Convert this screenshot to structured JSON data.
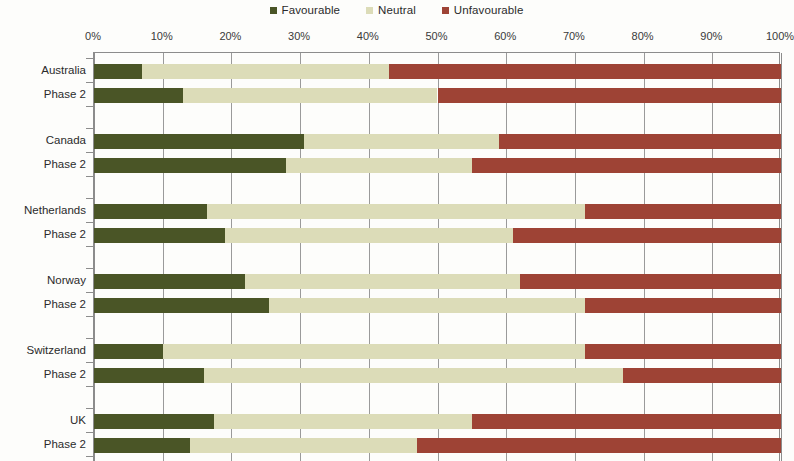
{
  "legend": {
    "items": [
      {
        "label": "Favourable",
        "color": "#4a5526"
      },
      {
        "label": "Neutral",
        "color": "#dcdcb8"
      },
      {
        "label": "Unfavourable",
        "color": "#9e4335"
      }
    ]
  },
  "axis": {
    "x_ticks": [
      "0%",
      "10%",
      "20%",
      "30%",
      "40%",
      "50%",
      "60%",
      "70%",
      "80%",
      "90%",
      "100%"
    ]
  },
  "chart_data": {
    "type": "bar",
    "orientation": "horizontal",
    "stacked": true,
    "stack_total": 100,
    "title": "",
    "xlabel": "",
    "ylabel": "",
    "xlim": [
      0,
      100
    ],
    "xticks": [
      0,
      10,
      20,
      30,
      40,
      50,
      60,
      70,
      80,
      90,
      100
    ],
    "xtick_labels": [
      "0%",
      "10%",
      "20%",
      "30%",
      "40%",
      "50%",
      "60%",
      "70%",
      "80%",
      "90%",
      "100%"
    ],
    "grid": true,
    "legend_position": "top-center",
    "categories": [
      "Australia",
      "Phase 2",
      "Canada",
      "Phase 2",
      "Netherlands",
      "Phase 2",
      "Norway",
      "Phase 2",
      "Switzerland",
      "Phase 2",
      "UK",
      "Phase 2"
    ],
    "groups": [
      {
        "country": "Australia",
        "rows": [
          "Australia",
          "Phase 2"
        ]
      },
      {
        "country": "Canada",
        "rows": [
          "Canada",
          "Phase 2"
        ]
      },
      {
        "country": "Netherlands",
        "rows": [
          "Netherlands",
          "Phase 2"
        ]
      },
      {
        "country": "Norway",
        "rows": [
          "Norway",
          "Phase 2"
        ]
      },
      {
        "country": "Switzerland",
        "rows": [
          "Switzerland",
          "Phase 2"
        ]
      },
      {
        "country": "UK",
        "rows": [
          "UK",
          "Phase 2"
        ]
      }
    ],
    "series": [
      {
        "name": "Favourable",
        "color": "#4a5526",
        "values": [
          7,
          13,
          30.5,
          28,
          16.5,
          19,
          22,
          25.5,
          10,
          16,
          17.5,
          14
        ]
      },
      {
        "name": "Neutral",
        "color": "#dcdcb8",
        "values": [
          36,
          37,
          28.5,
          27,
          55,
          42,
          40,
          46,
          61.5,
          61,
          37.5,
          33
        ]
      },
      {
        "name": "Unfavourable",
        "color": "#9e4335",
        "values": [
          57,
          50,
          41,
          45,
          28.5,
          39,
          38,
          28.5,
          28.5,
          23,
          45,
          53
        ]
      }
    ],
    "rows": [
      {
        "label": "Australia",
        "favourable": 7,
        "neutral": 36,
        "unfavourable": 57
      },
      {
        "label": "Phase 2",
        "favourable": 13,
        "neutral": 37,
        "unfavourable": 50
      },
      {
        "label": "Canada",
        "favourable": 30.5,
        "neutral": 28.5,
        "unfavourable": 41
      },
      {
        "label": "Phase 2",
        "favourable": 28,
        "neutral": 27,
        "unfavourable": 45
      },
      {
        "label": "Netherlands",
        "favourable": 16.5,
        "neutral": 55,
        "unfavourable": 28.5
      },
      {
        "label": "Phase 2",
        "favourable": 19,
        "neutral": 42,
        "unfavourable": 39
      },
      {
        "label": "Norway",
        "favourable": 22,
        "neutral": 40,
        "unfavourable": 38
      },
      {
        "label": "Phase 2",
        "favourable": 25.5,
        "neutral": 46,
        "unfavourable": 28.5
      },
      {
        "label": "Switzerland",
        "favourable": 10,
        "neutral": 61.5,
        "unfavourable": 28.5
      },
      {
        "label": "Phase 2",
        "favourable": 16,
        "neutral": 61,
        "unfavourable": 23
      },
      {
        "label": "UK",
        "favourable": 17.5,
        "neutral": 37.5,
        "unfavourable": 45
      },
      {
        "label": "Phase 2",
        "favourable": 14,
        "neutral": 33,
        "unfavourable": 53
      }
    ]
  }
}
